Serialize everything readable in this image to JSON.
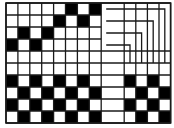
{
  "diagram": {
    "type": "weaving-draft",
    "colors": {
      "filled": "#000000",
      "empty": "#ffffff",
      "line": "#1a1a1a"
    },
    "rows": 10,
    "left_columns": 8,
    "right_columns": 4,
    "threading": [
      {
        "row": 0,
        "filled": [
          5,
          7
        ]
      },
      {
        "row": 1,
        "filled": [
          4,
          6
        ]
      },
      {
        "row": 2,
        "filled": [
          1,
          3
        ]
      },
      {
        "row": 3,
        "filled": [
          0,
          2
        ]
      }
    ],
    "drawdown_left": [
      {
        "row": 6,
        "filled": [
          0,
          2,
          4,
          6
        ]
      },
      {
        "row": 7,
        "filled": [
          1,
          3,
          5,
          7
        ]
      },
      {
        "row": 8,
        "filled": [
          0,
          2,
          4,
          6
        ]
      },
      {
        "row": 9,
        "filled": [
          1,
          3,
          5,
          7
        ]
      }
    ],
    "drawdown_right": [
      {
        "row": 6,
        "filled": [
          0,
          2
        ]
      },
      {
        "row": 7,
        "filled": [
          1,
          3
        ]
      },
      {
        "row": 8,
        "filled": [
          0,
          2
        ]
      },
      {
        "row": 9,
        "filled": [
          1,
          3
        ]
      }
    ],
    "tieup_connectors": [
      {
        "from_row": 0,
        "to_right_column": 3
      },
      {
        "from_row": 1,
        "to_right_column": 2
      },
      {
        "from_row": 2,
        "to_right_column": 1
      },
      {
        "from_row": 3,
        "to_right_column": 0
      }
    ]
  }
}
